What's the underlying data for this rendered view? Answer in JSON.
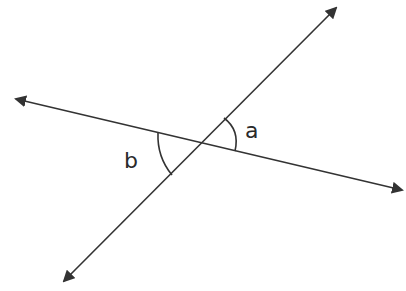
{
  "diagram": {
    "type": "intersecting-lines-angles",
    "colors": {
      "stroke": "#333333",
      "background": "#ffffff",
      "text": "#2a2a2a"
    },
    "lines": [
      {
        "name": "line-1",
        "from": [
          14,
          99
        ],
        "to": [
          404,
          190
        ],
        "arrowheads": "both"
      },
      {
        "name": "line-2",
        "from": [
          62,
          283
        ],
        "to": [
          338,
          6
        ],
        "arrowheads": "both"
      }
    ],
    "intersection": [
      200,
      142
    ],
    "angles": [
      {
        "label": "a",
        "position": "right-upper"
      },
      {
        "label": "b",
        "position": "left-lower"
      }
    ]
  }
}
